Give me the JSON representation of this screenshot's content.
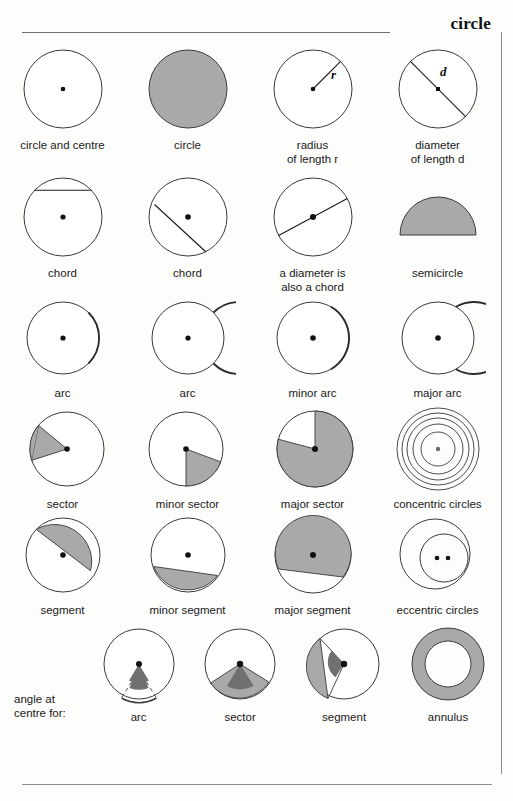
{
  "page": {
    "title": "circle",
    "colors": {
      "fill_gray": "#a9a9a9",
      "fill_dark_gray": "#707070",
      "stroke": "#3a3a3a",
      "rule": "#8c8c8c",
      "background": "#fdfdfc"
    }
  },
  "rows": [
    {
      "name": "row-basics",
      "cells": [
        {
          "name": "circle-and-centre",
          "caption": "circle and centre",
          "figure": "circle-with-centre-dot"
        },
        {
          "name": "circle-filled",
          "caption": "circle",
          "figure": "filled-circle"
        },
        {
          "name": "radius",
          "caption": "radius\nof length r",
          "figure": "circle-with-radius",
          "label": "r"
        },
        {
          "name": "diameter",
          "caption": "diameter\nof length d",
          "figure": "circle-with-diameter",
          "label": "d"
        }
      ]
    },
    {
      "name": "row-chords",
      "cells": [
        {
          "name": "chord-horizontal",
          "caption": "chord",
          "figure": "circle-with-horizontal-chord"
        },
        {
          "name": "chord-diagonal",
          "caption": "chord",
          "figure": "circle-with-diagonal-chord"
        },
        {
          "name": "diameter-chord",
          "caption": "a diameter is\nalso a chord",
          "figure": "circle-with-diameter-chord"
        },
        {
          "name": "semicircle",
          "caption": "semicircle",
          "figure": "filled-semicircle"
        }
      ]
    },
    {
      "name": "row-arcs",
      "cells": [
        {
          "name": "arc-1",
          "caption": "arc",
          "figure": "circle-with-arc-highlight-small"
        },
        {
          "name": "arc-2",
          "caption": "arc",
          "figure": "circle-with-arc-highlight-large"
        },
        {
          "name": "minor-arc",
          "caption": "minor arc",
          "figure": "circle-with-minor-arc"
        },
        {
          "name": "major-arc",
          "caption": "major arc",
          "figure": "circle-with-major-arc"
        }
      ]
    },
    {
      "name": "row-sectors",
      "cells": [
        {
          "name": "sector",
          "caption": "sector",
          "figure": "circle-with-sector"
        },
        {
          "name": "minor-sector",
          "caption": "minor sector",
          "figure": "circle-with-minor-sector"
        },
        {
          "name": "major-sector",
          "caption": "major sector",
          "figure": "circle-with-major-sector"
        },
        {
          "name": "concentric-circles",
          "caption": "concentric circles",
          "figure": "concentric-circles"
        }
      ]
    },
    {
      "name": "row-segments",
      "cells": [
        {
          "name": "segment",
          "caption": "segment",
          "figure": "circle-with-segment"
        },
        {
          "name": "minor-segment",
          "caption": "minor segment",
          "figure": "circle-with-minor-segment"
        },
        {
          "name": "major-segment",
          "caption": "major segment",
          "figure": "circle-with-major-segment"
        },
        {
          "name": "eccentric-circles",
          "caption": "eccentric circles",
          "figure": "eccentric-circles"
        }
      ]
    },
    {
      "name": "row-angle-at-centre",
      "lead_label": "angle at\ncentre for:",
      "cells": [
        {
          "name": "angle-arc",
          "caption": "arc",
          "figure": "angle-at-centre-arc"
        },
        {
          "name": "angle-sector",
          "caption": "sector",
          "figure": "angle-at-centre-sector"
        },
        {
          "name": "angle-segment",
          "caption": "segment",
          "figure": "angle-at-centre-segment"
        },
        {
          "name": "annulus",
          "caption": "annulus",
          "figure": "annulus"
        }
      ]
    }
  ]
}
